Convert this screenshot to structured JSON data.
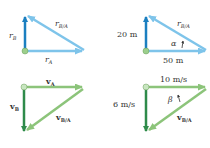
{
  "panels": [
    {
      "id": "position-symbolic",
      "labels": {
        "vertical": "r",
        "vertical_sub": "B",
        "horizontal": "r",
        "horizontal_sub": "A",
        "hypotenuse": "r",
        "hypotenuse_sub": "B/A"
      }
    },
    {
      "id": "position-numeric",
      "labels": {
        "vertical": "20 m",
        "horizontal": "50 m",
        "hypotenuse": "r",
        "hypotenuse_sub": "B/A",
        "angle": "α"
      }
    },
    {
      "id": "velocity-symbolic",
      "labels": {
        "vertical": "v",
        "vertical_sub": "B",
        "horizontal": "v",
        "horizontal_sub": "A",
        "hypotenuse": "v",
        "hypotenuse_sub": "B/A"
      }
    },
    {
      "id": "velocity-numeric",
      "labels": {
        "vertical": "6 m/s",
        "horizontal": "10 m/s",
        "hypotenuse": "v",
        "hypotenuse_sub": "B/A",
        "angle": "β"
      }
    }
  ],
  "colors": {
    "position_dark": "#1b7fc0",
    "position_light": "#7ec4ea",
    "velocity_dark": "#2e8b4a",
    "velocity_light": "#8cc47a",
    "origin_dot": "#9ccf8c"
  }
}
